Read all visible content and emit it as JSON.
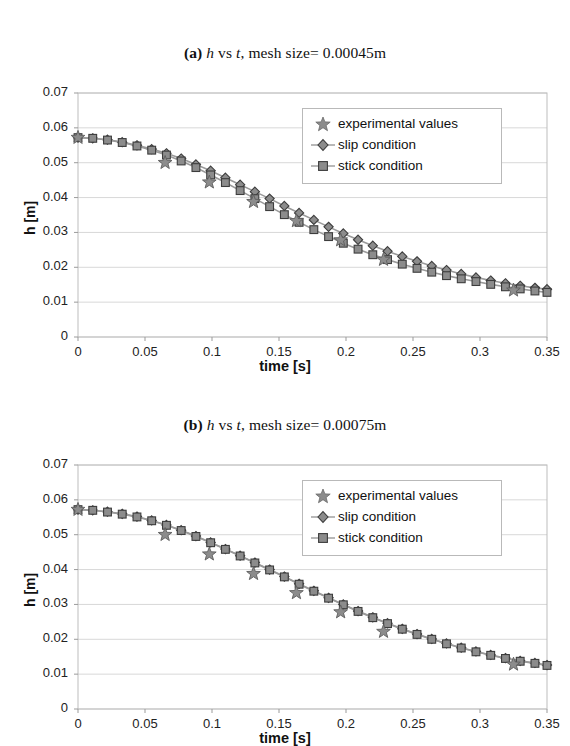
{
  "figures": [
    {
      "id": "fig-a",
      "title_label": "(a)",
      "title_var1": "h",
      "title_mid": "vs",
      "title_var2": "t",
      "title_rest": ", mesh size= 0.00045m",
      "title_plain": "(a) h vs t, mesh size= 0.00045m",
      "legend": {
        "experimental": "experimental values",
        "slip": "slip condition",
        "stick": "stick condition"
      }
    },
    {
      "id": "fig-b",
      "title_label": "(b)",
      "title_var1": "h",
      "title_mid": "vs",
      "title_var2": "t",
      "title_rest": ", mesh size= 0.00075m",
      "title_plain": "(b) h vs t, mesh size= 0.00075m",
      "legend": {
        "experimental": "experimental values",
        "slip": "slip condition",
        "stick": "stick condition"
      }
    }
  ],
  "axes": {
    "xlabel": "time [s]",
    "ylabel": "h [m]",
    "xticks": [
      "0",
      "0.05",
      "0.1",
      "0.15",
      "0.2",
      "0.25",
      "0.3",
      "0.35"
    ],
    "xtick_values": [
      0,
      0.05,
      0.1,
      0.15,
      0.2,
      0.25,
      0.3,
      0.35
    ],
    "yticks": [
      "0",
      "0.01",
      "0.02",
      "0.03",
      "0.04",
      "0.05",
      "0.06",
      "0.07"
    ],
    "ytick_values": [
      0,
      0.01,
      0.02,
      0.03,
      0.04,
      0.05,
      0.06,
      0.07
    ],
    "xlim": [
      0,
      0.35
    ],
    "ylim": [
      0,
      0.07
    ]
  },
  "colors": {
    "marker_fill": "#8c8c8c",
    "marker_stroke": "#3d3d3d",
    "line": "#9a9a9a",
    "grid": "#d8d8d8",
    "frame": "#bdbdbd",
    "text": "#111111",
    "background": "#ffffff"
  },
  "chart_data": [
    {
      "type": "line",
      "id": "fig-a",
      "title": "(a) h vs t, mesh size= 0.00045m",
      "xlabel": "time [s]",
      "ylabel": "h [m]",
      "xlim": [
        0,
        0.35
      ],
      "ylim": [
        0,
        0.07
      ],
      "grid": "horizontal",
      "legend_position": "upper-right",
      "series": [
        {
          "name": "experimental values",
          "marker": "star",
          "x": [
            0.0,
            0.065,
            0.098,
            0.131,
            0.163,
            0.196,
            0.228,
            0.325
          ],
          "y": [
            0.0572,
            0.05,
            0.0444,
            0.0388,
            0.0333,
            0.0278,
            0.0222,
            0.0134
          ]
        },
        {
          "name": "slip condition",
          "marker": "diamond",
          "x": [
            0.0,
            0.011,
            0.022,
            0.033,
            0.044,
            0.055,
            0.066,
            0.077,
            0.088,
            0.099,
            0.11,
            0.121,
            0.132,
            0.143,
            0.154,
            0.165,
            0.176,
            0.187,
            0.198,
            0.209,
            0.22,
            0.231,
            0.242,
            0.253,
            0.264,
            0.275,
            0.286,
            0.297,
            0.308,
            0.319,
            0.33,
            0.341,
            0.35
          ],
          "y": [
            0.0572,
            0.057,
            0.0566,
            0.0559,
            0.055,
            0.0539,
            0.0527,
            0.0512,
            0.0495,
            0.0477,
            0.0457,
            0.0437,
            0.0417,
            0.0397,
            0.0376,
            0.0356,
            0.0336,
            0.0316,
            0.0297,
            0.0279,
            0.0262,
            0.0246,
            0.0231,
            0.0217,
            0.0204,
            0.0192,
            0.0181,
            0.0171,
            0.0162,
            0.0154,
            0.0147,
            0.0141,
            0.0137
          ]
        },
        {
          "name": "stick condition",
          "marker": "square",
          "x": [
            0.0,
            0.011,
            0.022,
            0.033,
            0.044,
            0.055,
            0.066,
            0.077,
            0.088,
            0.099,
            0.11,
            0.121,
            0.132,
            0.143,
            0.154,
            0.165,
            0.176,
            0.187,
            0.198,
            0.209,
            0.22,
            0.231,
            0.242,
            0.253,
            0.264,
            0.275,
            0.286,
            0.297,
            0.308,
            0.319,
            0.33,
            0.341,
            0.35
          ],
          "y": [
            0.0572,
            0.057,
            0.0565,
            0.0558,
            0.0548,
            0.0536,
            0.0522,
            0.0505,
            0.0486,
            0.0465,
            0.0443,
            0.042,
            0.0397,
            0.0374,
            0.0351,
            0.0329,
            0.0308,
            0.0288,
            0.0269,
            0.0252,
            0.0236,
            0.0222,
            0.0209,
            0.0197,
            0.0186,
            0.0176,
            0.0167,
            0.0159,
            0.0151,
            0.0144,
            0.0138,
            0.0132,
            0.0128
          ]
        }
      ]
    },
    {
      "type": "line",
      "id": "fig-b",
      "title": "(b) h vs t, mesh size= 0.00075m",
      "xlabel": "time [s]",
      "ylabel": "h [m]",
      "xlim": [
        0,
        0.35
      ],
      "ylim": [
        0,
        0.07
      ],
      "grid": "horizontal",
      "legend_position": "upper-right",
      "series": [
        {
          "name": "experimental values",
          "marker": "star",
          "x": [
            0.0,
            0.065,
            0.098,
            0.131,
            0.163,
            0.196,
            0.228,
            0.325
          ],
          "y": [
            0.0572,
            0.05,
            0.0444,
            0.0388,
            0.0333,
            0.0278,
            0.0222,
            0.0128
          ]
        },
        {
          "name": "slip condition",
          "marker": "diamond",
          "x": [
            0.0,
            0.011,
            0.022,
            0.033,
            0.044,
            0.055,
            0.066,
            0.077,
            0.088,
            0.099,
            0.11,
            0.121,
            0.132,
            0.143,
            0.154,
            0.165,
            0.176,
            0.187,
            0.198,
            0.209,
            0.22,
            0.231,
            0.242,
            0.253,
            0.264,
            0.275,
            0.286,
            0.297,
            0.308,
            0.319,
            0.33,
            0.341,
            0.35
          ],
          "y": [
            0.0572,
            0.057,
            0.0566,
            0.056,
            0.0552,
            0.0541,
            0.0528,
            0.0513,
            0.0496,
            0.0478,
            0.0459,
            0.044,
            0.042,
            0.04,
            0.038,
            0.0359,
            0.0339,
            0.0319,
            0.03,
            0.0281,
            0.0263,
            0.0246,
            0.023,
            0.0215,
            0.0201,
            0.0188,
            0.0176,
            0.0165,
            0.0155,
            0.0146,
            0.0138,
            0.0132,
            0.0126
          ]
        },
        {
          "name": "stick condition",
          "marker": "square",
          "x": [
            0.0,
            0.011,
            0.022,
            0.033,
            0.044,
            0.055,
            0.066,
            0.077,
            0.088,
            0.099,
            0.11,
            0.121,
            0.132,
            0.143,
            0.154,
            0.165,
            0.176,
            0.187,
            0.198,
            0.209,
            0.22,
            0.231,
            0.242,
            0.253,
            0.264,
            0.275,
            0.286,
            0.297,
            0.308,
            0.319,
            0.33,
            0.341,
            0.35
          ],
          "y": [
            0.0572,
            0.057,
            0.0565,
            0.0559,
            0.0551,
            0.054,
            0.0527,
            0.0512,
            0.0495,
            0.0477,
            0.0458,
            0.0439,
            0.0419,
            0.0399,
            0.0379,
            0.0358,
            0.0338,
            0.0318,
            0.0299,
            0.028,
            0.0262,
            0.0245,
            0.0229,
            0.0214,
            0.02,
            0.0187,
            0.0175,
            0.0164,
            0.0154,
            0.0145,
            0.0137,
            0.0131,
            0.0125
          ]
        }
      ]
    }
  ]
}
